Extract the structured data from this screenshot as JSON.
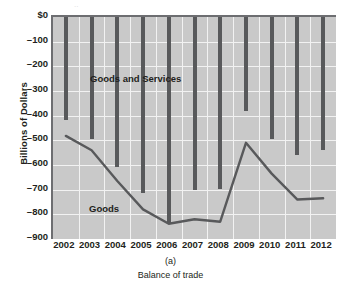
{
  "figure": {
    "panel_id": "(a)",
    "caption": "Balance of trade",
    "ylabel": "Billions of Dollars",
    "series_labels": {
      "goods_and_services": "Goods and Services",
      "goods": "Goods"
    },
    "colors": {
      "plot_background": "#c9c9c9",
      "gridline": "#f2f2f2",
      "bar": "#58595b",
      "line": "#58595b",
      "axis": "#6d6e71",
      "text": "#231f20"
    }
  },
  "chart_data": {
    "type": "bar",
    "title": "",
    "xlabel": "Balance of trade",
    "ylabel": "Billions of Dollars",
    "categories": [
      "2002",
      "2003",
      "2004",
      "2005",
      "2006",
      "2007",
      "2008",
      "2009",
      "2010",
      "2011",
      "2012"
    ],
    "ylim": [
      -900,
      0
    ],
    "ytick_labels": [
      "$0",
      "–100",
      "–200",
      "–300",
      "–400",
      "–500",
      "–600",
      "–700",
      "–800",
      "–900"
    ],
    "ytick_values": [
      0,
      -100,
      -200,
      -300,
      -400,
      -500,
      -600,
      -700,
      -800,
      -900
    ],
    "grid": true,
    "legend_position": "inline-annotation",
    "series": [
      {
        "name": "Goods and Services",
        "render": "bar",
        "values": [
          -418,
          -495,
          -610,
          -712,
          -838,
          -700,
          -698,
          -382,
          -495,
          -560,
          -540
        ]
      },
      {
        "name": "Goods",
        "render": "line",
        "values": [
          -482,
          -540,
          -665,
          -780,
          -838,
          -820,
          -830,
          -510,
          -635,
          -740,
          -735
        ]
      }
    ]
  }
}
